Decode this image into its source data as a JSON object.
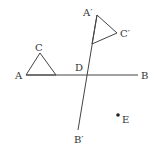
{
  "diagram": {
    "stroke_color": "#444444",
    "labels": {
      "A": "A",
      "B": "B",
      "C": "C",
      "D": "D",
      "E": "E",
      "A_prime": "A′",
      "B_prime": "B′",
      "C_prime": "C′"
    },
    "segments": [
      {
        "name": "AB",
        "from": [
          26,
          75
        ],
        "to": [
          138,
          75
        ]
      },
      {
        "name": "A'B'",
        "from": [
          97,
          15
        ],
        "to": [
          78,
          130
        ]
      }
    ],
    "triangles": [
      {
        "name": "triangle-ACX",
        "points": [
          [
            26,
            75
          ],
          [
            40,
            53
          ],
          [
            56,
            75
          ]
        ]
      },
      {
        "name": "triangle-A'C'X'",
        "points": [
          [
            97,
            15
          ],
          [
            117,
            33
          ],
          [
            92,
            44
          ]
        ]
      }
    ],
    "points": [
      {
        "name": "E",
        "at": [
          118,
          115
        ]
      }
    ]
  }
}
